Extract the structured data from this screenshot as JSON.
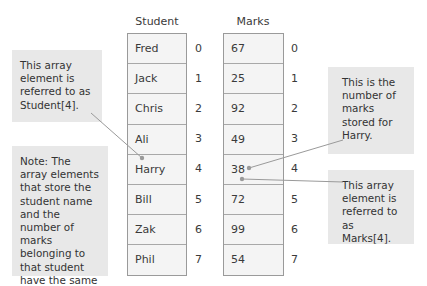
{
  "arrays": {
    "student": {
      "header": "Student",
      "values": [
        "Fred",
        "Jack",
        "Chris",
        "Ali",
        "Harry",
        "Bill",
        "Zak",
        "Phil"
      ]
    },
    "marks": {
      "header": "Marks",
      "values": [
        "67",
        "25",
        "92",
        "49",
        "38",
        "72",
        "99",
        "54"
      ]
    },
    "indices": [
      "0",
      "1",
      "2",
      "3",
      "4",
      "5",
      "6",
      "7"
    ]
  },
  "callouts": {
    "student_ref": "This array element is referred to as Student[4].",
    "note": "Note: The array elements that store the student name and the number of marks belonging to that student have the same index.",
    "marks_for_harry": "This is the number of marks stored for Harry.",
    "marks_ref": "This array element is referred to as Marks[4]."
  },
  "colors": {
    "cell_fill": "#f4f4f4",
    "cell_border": "#9a9a9a",
    "callout_fill": "#e8e8e8",
    "leader_line": "#9a9a9a",
    "text": "#333333"
  }
}
